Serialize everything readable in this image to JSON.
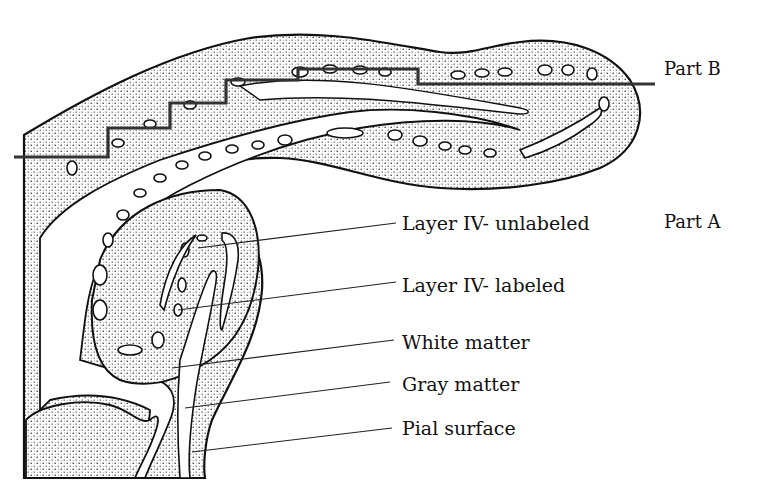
{
  "figure": {
    "part_labels": [
      {
        "id": "part-b",
        "text": "Part B"
      },
      {
        "id": "part-a",
        "text": "Part A"
      }
    ],
    "callouts": [
      {
        "id": "layer-iv-unlabeled",
        "text": "Layer IV- unlabeled"
      },
      {
        "id": "layer-iv-labeled",
        "text": "Layer IV- labeled"
      },
      {
        "id": "white-matter",
        "text": "White matter"
      },
      {
        "id": "gray-matter",
        "text": "Gray matter"
      },
      {
        "id": "pial-surface",
        "text": "Pial surface"
      }
    ],
    "colors": {
      "ink": "#111111",
      "background": "#ffffff"
    }
  }
}
